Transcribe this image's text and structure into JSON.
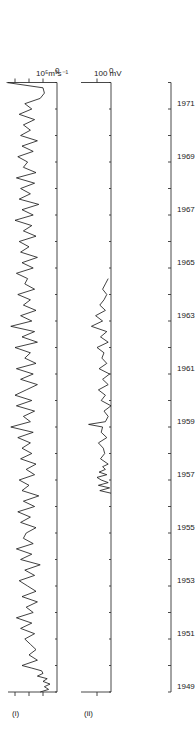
{
  "chart_data": [
    {
      "type": "line",
      "panel_label": "(i)",
      "title": "",
      "xlabel": "",
      "ylabel": "10^5 m^3 s^-1",
      "y_tick_labels": [
        "0",
        "10⁵m³s⁻¹"
      ],
      "x_range": [
        1949,
        1972
      ],
      "ylim": [
        0,
        3.5
      ],
      "grid": false,
      "series": [
        {
          "name": "transport",
          "x": [
            1949.0,
            1949.1,
            1949.2,
            1949.3,
            1949.4,
            1949.5,
            1949.6,
            1949.7,
            1949.8,
            1949.9,
            1950.0,
            1950.2,
            1950.4,
            1950.6,
            1950.8,
            1951.0,
            1951.2,
            1951.4,
            1951.6,
            1951.8,
            1952.0,
            1952.2,
            1952.4,
            1952.6,
            1952.8,
            1953.0,
            1953.2,
            1953.4,
            1953.6,
            1953.8,
            1954.0,
            1954.2,
            1954.4,
            1954.6,
            1954.8,
            1955.0,
            1955.2,
            1955.4,
            1955.6,
            1955.8,
            1956.0,
            1956.2,
            1956.4,
            1956.6,
            1956.8,
            1957.0,
            1957.2,
            1957.4,
            1957.6,
            1957.8,
            1958.0,
            1958.2,
            1958.4,
            1958.6,
            1958.8,
            1959.0,
            1959.2,
            1959.4,
            1959.6,
            1959.8,
            1960.0,
            1960.2,
            1960.4,
            1960.6,
            1960.8,
            1961.0,
            1961.2,
            1961.4,
            1961.6,
            1961.8,
            1962.0,
            1962.2,
            1962.4,
            1962.6,
            1962.8,
            1963.0,
            1963.2,
            1963.4,
            1963.6,
            1963.8,
            1964.0,
            1964.2,
            1964.4,
            1964.6,
            1964.8,
            1965.0,
            1965.2,
            1965.4,
            1965.6,
            1965.8,
            1966.0,
            1966.2,
            1966.4,
            1966.6,
            1966.8,
            1967.0,
            1967.2,
            1967.4,
            1967.6,
            1967.8,
            1968.0,
            1968.2,
            1968.4,
            1968.6,
            1968.8,
            1969.0,
            1969.2,
            1969.4,
            1969.6,
            1969.8,
            1970.0,
            1970.2,
            1970.4,
            1970.6,
            1970.8,
            1971.0,
            1971.2,
            1971.4,
            1971.6,
            1971.8,
            1972.0
          ],
          "values": [
            1.2,
            0.6,
            0.9,
            0.5,
            1.0,
            0.7,
            1.4,
            1.0,
            1.1,
            1.8,
            2.5,
            1.4,
            2.0,
            1.5,
            1.9,
            2.3,
            1.6,
            2.6,
            1.8,
            2.9,
            1.7,
            2.2,
            1.4,
            2.5,
            1.5,
            2.1,
            2.7,
            1.6,
            2.3,
            1.2,
            2.6,
            1.8,
            2.9,
            1.7,
            2.4,
            2.2,
            1.5,
            2.6,
            1.9,
            2.8,
            1.6,
            2.4,
            1.3,
            2.5,
            2.0,
            2.7,
            1.6,
            2.2,
            1.5,
            2.6,
            1.8,
            2.5,
            1.9,
            2.8,
            1.7,
            3.3,
            1.9,
            2.4,
            1.6,
            2.9,
            1.8,
            3.0,
            2.2,
            1.4,
            2.6,
            1.7,
            2.9,
            1.5,
            2.3,
            1.9,
            3.0,
            1.4,
            2.5,
            1.6,
            3.3,
            1.8,
            2.6,
            1.5,
            2.4,
            1.9,
            2.8,
            1.6,
            2.3,
            2.1,
            2.9,
            1.7,
            2.5,
            1.4,
            2.6,
            2.0,
            2.7,
            1.5,
            2.4,
            1.8,
            3.0,
            1.7,
            2.5,
            1.3,
            2.7,
            1.9,
            2.6,
            1.6,
            2.9,
            1.5,
            2.4,
            2.1,
            2.8,
            1.7,
            2.5,
            1.4,
            2.6,
            1.9,
            2.4,
            1.6,
            2.7,
            1.8,
            2.3,
            1.2,
            0.9,
            1.0,
            3.6
          ]
        }
      ]
    },
    {
      "type": "line",
      "panel_label": "(ii)",
      "title": "",
      "xlabel": "",
      "ylabel": "mV",
      "y_tick_labels": [
        "0",
        "100 mV"
      ],
      "x_range": [
        1949,
        1972
      ],
      "ylim": [
        -50,
        200
      ],
      "grid": false,
      "series": [
        {
          "name": "voltage",
          "x": [
            1956.5,
            1956.6,
            1956.7,
            1956.8,
            1956.9,
            1957.0,
            1957.1,
            1957.2,
            1957.3,
            1957.4,
            1957.5,
            1957.6,
            1957.8,
            1958.0,
            1958.2,
            1958.4,
            1958.6,
            1958.8,
            1959.0,
            1959.1,
            1959.2,
            1959.4,
            1959.6,
            1959.8,
            1960.0,
            1960.2,
            1960.4,
            1960.6,
            1960.8,
            1961.0,
            1961.2,
            1961.4,
            1961.6,
            1961.8,
            1962.0,
            1962.2,
            1962.4,
            1962.6,
            1962.8,
            1963.0,
            1963.2,
            1963.4,
            1963.6,
            1963.8,
            1964.0,
            1964.2,
            1964.4,
            1964.6
          ],
          "values": [
            0,
            80,
            10,
            90,
            20,
            70,
            100,
            30,
            85,
            40,
            60,
            20,
            75,
            45,
            55,
            90,
            30,
            70,
            60,
            160,
            40,
            20,
            50,
            0,
            70,
            40,
            90,
            20,
            60,
            10,
            85,
            30,
            65,
            50,
            100,
            20,
            75,
            30,
            140,
            60,
            110,
            40,
            80,
            50,
            30,
            60,
            40,
            20
          ]
        }
      ]
    },
    {
      "type": "axis",
      "x_tick_labels": [
        "1949",
        "1951",
        "1953",
        "1955",
        "1957",
        "1959",
        "1961",
        "1963",
        "1965",
        "1967",
        "1969",
        "1971"
      ]
    }
  ],
  "labels": {
    "panel_i": "(i)",
    "panel_ii": "(ii)",
    "unit_i": "10⁵m³s⁻¹",
    "zero_i": "0",
    "unit_ii": "100 mV",
    "zero_ii": "0"
  }
}
